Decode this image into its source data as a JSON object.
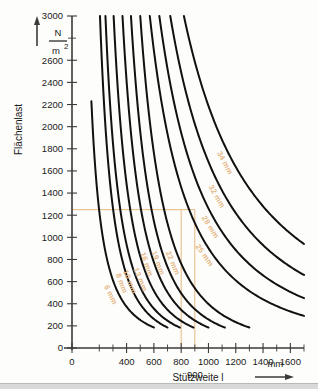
{
  "chart_data": {
    "type": "line",
    "title": "",
    "xlabel": "Stützweite l",
    "ylabel": "Flächenlast",
    "x_unit": "mm",
    "y_unit_numerator": "N",
    "y_unit_denominator": "m",
    "y_unit_exponent": "2",
    "xlim": [
      0,
      1700
    ],
    "ylim": [
      0,
      3000
    ],
    "grid": false,
    "legend": "inline-curve-labels",
    "x_major_ticks": [
      0,
      400,
      600,
      800,
      1000,
      1200,
      1400,
      1600
    ],
    "x_minor_ticks": [
      200,
      300,
      500,
      700,
      900,
      1100,
      1300,
      1500,
      1700
    ],
    "y_major_ticks": [
      0,
      200,
      400,
      600,
      800,
      1000,
      1200,
      1400,
      1600,
      1800,
      2000,
      2200,
      2400,
      2600,
      3000
    ],
    "y_tick_labels": [
      "0",
      "200",
      "400",
      "600",
      "800",
      "1000",
      "1200",
      "1400",
      "1600",
      "1800",
      "2000",
      "2200",
      "2400",
      "2600",
      "3000"
    ],
    "series": [
      {
        "name": "6 mm",
        "thickness_mm": 6,
        "label": "6 mm",
        "x_start": 142,
        "x_end": 600,
        "y_start": 2230,
        "y_end": 185
      },
      {
        "name": "8 mm",
        "thickness_mm": 8,
        "label": "8 mm",
        "x_start": 205,
        "x_end": 700,
        "y_start": 3000,
        "y_end": 185
      },
      {
        "name": "10 mm",
        "thickness_mm": 10,
        "label": "10 mm",
        "x_start": 245,
        "x_end": 790,
        "y_start": 3000,
        "y_end": 185
      },
      {
        "name": "13 mm",
        "thickness_mm": 13,
        "label": "13 mm",
        "x_start": 305,
        "x_end": 890,
        "y_start": 3000,
        "y_end": 185
      },
      {
        "name": "16 mm",
        "thickness_mm": 16,
        "label": "16 mm",
        "x_start": 370,
        "x_end": 1000,
        "y_start": 3000,
        "y_end": 185
      },
      {
        "name": "19 mm",
        "thickness_mm": 19,
        "label": "19 mm",
        "x_start": 432,
        "x_end": 1120,
        "y_start": 3000,
        "y_end": 185
      },
      {
        "name": "22 mm",
        "thickness_mm": 22,
        "label": "22 mm",
        "x_start": 500,
        "x_end": 1300,
        "y_start": 3000,
        "y_end": 185
      },
      {
        "name": "25 mm",
        "thickness_mm": 25,
        "label": "25 mm",
        "x_start": 570,
        "x_end": 1700,
        "y_start": 3000,
        "y_end": 290
      },
      {
        "name": "28 mm",
        "thickness_mm": 28,
        "label": "28 mm",
        "x_start": 640,
        "x_end": 1700,
        "y_start": 3000,
        "y_end": 450
      },
      {
        "name": "32 mm",
        "thickness_mm": 32,
        "label": "32 mm",
        "x_start": 720,
        "x_end": 1700,
        "y_start": 3000,
        "y_end": 660
      },
      {
        "name": "34 mm",
        "thickness_mm": 34,
        "label": "34 mm",
        "x_start": 820,
        "x_end": 1700,
        "y_start": 3000,
        "y_end": 940
      }
    ],
    "annotations": {
      "construction_load": 1250,
      "construction_span_lower": 800,
      "construction_span_upper": 900,
      "extra_x_label": "900"
    }
  },
  "axes": {
    "y_title": "Flächenlast",
    "x_title": "Stützweite",
    "x_title_symbol": "l",
    "x_unit": "mm",
    "y_unit_num": "N",
    "y_unit_den": "m",
    "y_unit_exp": "2"
  },
  "colors": {
    "curve": "#111111",
    "guide": "#e8b77e",
    "label": "#e5b887",
    "axis": "#3a3a3a",
    "background": "#fdfdfb"
  }
}
